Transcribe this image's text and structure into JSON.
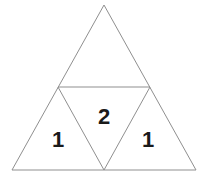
{
  "figure": {
    "type": "geometric-diagram",
    "shape": "equilateral-triangle-subdivided",
    "background_color": "#ffffff",
    "stroke_color": "#8f8f8f",
    "stroke_width": 1,
    "label_color": "#1a1a1a",
    "vertices": {
      "apex": [
        104,
        5
      ],
      "bottom_left": [
        12,
        170
      ],
      "bottom_right": [
        196,
        170
      ],
      "mid_left": [
        58,
        87
      ],
      "mid_right": [
        150,
        87
      ],
      "mid_bottom": [
        104,
        170
      ]
    },
    "regions": [
      {
        "name": "top-triangle",
        "label": "",
        "orientation": "upright",
        "points": "104,5 58,87 150,87"
      },
      {
        "name": "bottom-left-triangle",
        "label": "1",
        "orientation": "upright",
        "points": "58,87 12,170 104,170"
      },
      {
        "name": "middle-triangle",
        "label": "2",
        "orientation": "inverted",
        "points": "58,87 150,87 104,170"
      },
      {
        "name": "bottom-right-triangle",
        "label": "1",
        "orientation": "upright",
        "points": "150,87 104,170 196,170"
      }
    ],
    "edges": [
      {
        "name": "left-side",
        "from": "apex",
        "to": "bottom_left"
      },
      {
        "name": "right-side",
        "from": "apex",
        "to": "bottom_right"
      },
      {
        "name": "base",
        "from": "bottom_left",
        "to": "bottom_right"
      },
      {
        "name": "midsegment-horizontal",
        "from": "mid_left",
        "to": "mid_right"
      },
      {
        "name": "midsegment-left-diagonal",
        "from": "mid_left",
        "to": "mid_bottom"
      },
      {
        "name": "midsegment-right-diagonal",
        "from": "mid_right",
        "to": "mid_bottom"
      }
    ]
  }
}
